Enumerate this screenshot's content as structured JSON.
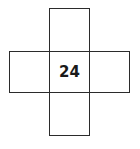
{
  "diagram": {
    "type": "cross-of-boxes",
    "center_value": "24",
    "cells": [
      {
        "position": "top",
        "value": ""
      },
      {
        "position": "left",
        "value": ""
      },
      {
        "position": "center",
        "value": "24"
      },
      {
        "position": "right",
        "value": ""
      },
      {
        "position": "bottom",
        "value": ""
      }
    ],
    "line_color": "#2b2b2b"
  }
}
